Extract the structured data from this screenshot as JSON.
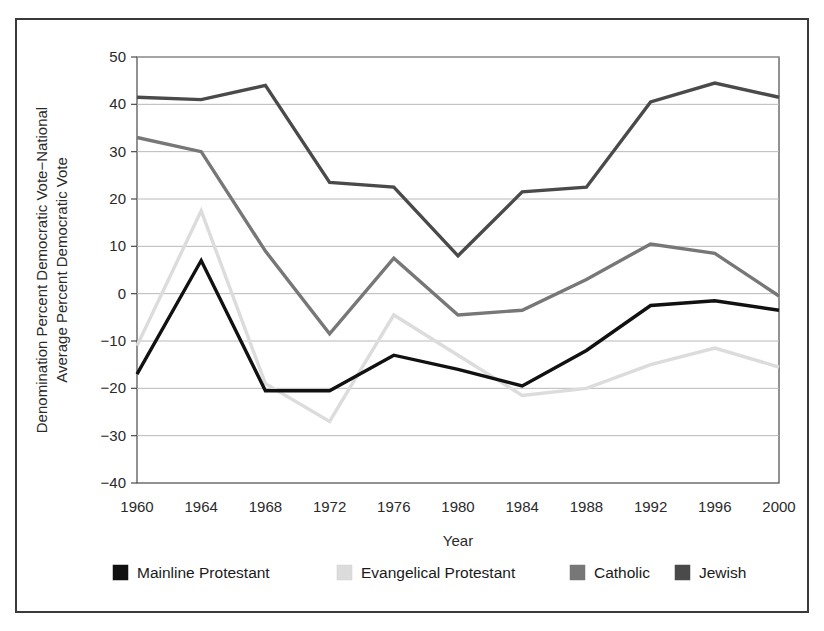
{
  "chart_data": {
    "type": "line",
    "title": "",
    "xlabel": "Year",
    "ylabel": "Denomination Percent Democratic Vote−National Average Percent Democratic Vote",
    "ylabel_line1": "Denomination Percent Democratic Vote−National",
    "ylabel_line2": "Average Percent Democratic Vote",
    "x": [
      1960,
      1964,
      1968,
      1972,
      1976,
      1980,
      1984,
      1988,
      1992,
      1996,
      2000
    ],
    "xtick_labels": [
      "1960",
      "1964",
      "1968",
      "1972",
      "1976",
      "1980",
      "1984",
      "1988",
      "1992",
      "1996",
      "2000"
    ],
    "ytick_labels": [
      "50",
      "40",
      "30",
      "20",
      "10",
      "0",
      "−10",
      "−20",
      "−30",
      "−40"
    ],
    "yticks": [
      50,
      40,
      30,
      20,
      10,
      0,
      -10,
      -20,
      -30,
      -40
    ],
    "ylim": [
      -40,
      50
    ],
    "xlim": [
      1960,
      2000
    ],
    "grid": "horizontal",
    "legend_position": "bottom",
    "series": [
      {
        "name": "Mainline Protestant",
        "color": "#111111",
        "values": [
          -17.0,
          7.0,
          -20.5,
          -20.5,
          -13.0,
          -16.0,
          -19.5,
          -12.0,
          -2.5,
          -1.5,
          -3.5
        ]
      },
      {
        "name": "Evangelical Protestant",
        "color": "#dcdcdc",
        "values": [
          -11.0,
          17.5,
          -19.0,
          -27.0,
          -4.5,
          -13.0,
          -21.5,
          -20.0,
          -15.0,
          -11.5,
          -15.5
        ]
      },
      {
        "name": "Catholic",
        "color": "#777777",
        "values": [
          33.0,
          30.0,
          9.0,
          -8.5,
          7.5,
          -4.5,
          -3.5,
          3.0,
          10.5,
          8.5,
          -0.5
        ]
      },
      {
        "name": "Jewish",
        "color": "#4a4a4a",
        "values": [
          41.5,
          41.0,
          44.0,
          23.5,
          22.5,
          8.0,
          21.5,
          22.5,
          40.5,
          44.5,
          41.5
        ]
      }
    ]
  },
  "legend": {
    "items": [
      {
        "label": "Mainline Protestant",
        "color": "#111111"
      },
      {
        "label": "Evangelical Protestant",
        "color": "#dcdcdc"
      },
      {
        "label": "Catholic",
        "color": "#777777"
      },
      {
        "label": "Jewish",
        "color": "#4a4a4a"
      }
    ]
  },
  "axes": {
    "x_title": "Year",
    "y_title_line1": "Denomination Percent Democratic Vote−National",
    "y_title_line2": "Average Percent Democratic Vote"
  }
}
